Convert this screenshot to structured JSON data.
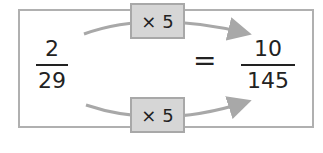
{
  "left_fraction": {
    "numerator": "2",
    "denominator": "29"
  },
  "right_fraction": {
    "numerator": "10",
    "denominator": "145"
  },
  "equals": "=",
  "top_operation": "× 5",
  "bottom_operation": "× 5",
  "colors": {
    "box_fill": "#d6d6d6",
    "border": "#b0b0b0",
    "arrow": "#a8a8a8",
    "text": "#222222"
  }
}
